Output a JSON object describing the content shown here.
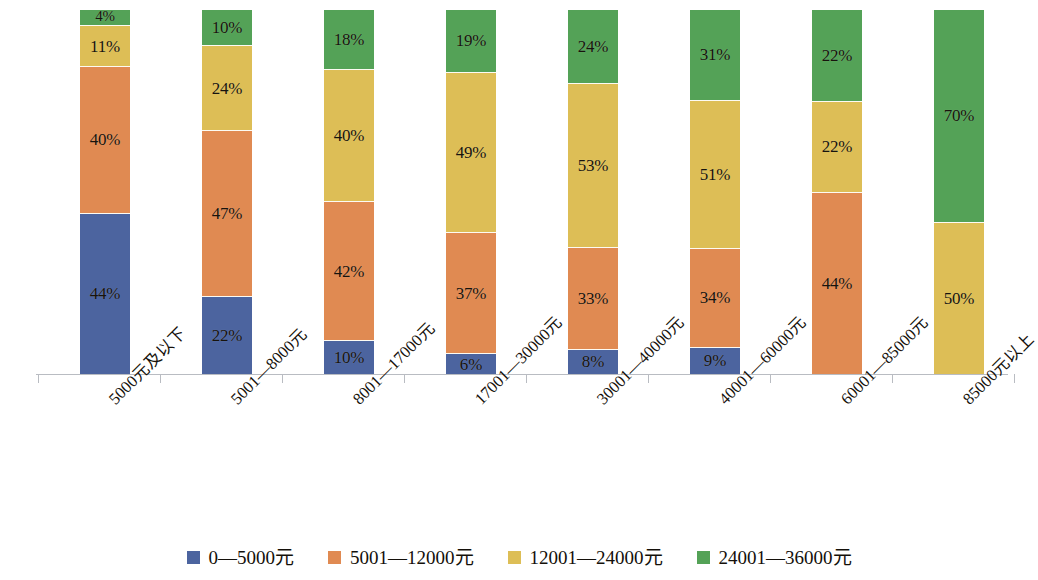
{
  "chart_data": {
    "type": "bar",
    "subtype": "stacked-100-percent",
    "title": "",
    "subtitle": "",
    "xlabel": "",
    "ylabel": "",
    "ylim": [
      0,
      100
    ],
    "grid": false,
    "legend_position": "bottom",
    "value_suffix": "%",
    "categories": [
      "5000元及以下",
      "5001—8000元",
      "8001—17000元",
      "17001—30000元",
      "30001—40000元",
      "40001—60000元",
      "60001—85000元",
      "85000元以上"
    ],
    "series": [
      {
        "name": "0—5000元",
        "color": "#4c649f",
        "values": [
          44,
          22,
          10,
          6,
          8,
          9,
          0,
          0
        ],
        "labels": [
          "44%",
          "22%",
          "10%",
          "6%",
          "8%",
          "9%",
          "",
          ""
        ]
      },
      {
        "name": "5001—12000元",
        "color": "#e08a52",
        "values": [
          40,
          47,
          42,
          37,
          33,
          34,
          44,
          0
        ],
        "labels": [
          "40%",
          "47%",
          "42%",
          "37%",
          "33%",
          "34%",
          "44%",
          ""
        ]
      },
      {
        "name": "12001—24000元",
        "color": "#ddbe56",
        "values": [
          11,
          24,
          40,
          49,
          53,
          51,
          22,
          50
        ],
        "labels": [
          "11%",
          "24%",
          "40%",
          "49%",
          "53%",
          "51%",
          "22%",
          "50%"
        ]
      },
      {
        "name": "24001—36000元",
        "color": "#54a257",
        "values": [
          4,
          10,
          18,
          19,
          24,
          31,
          22,
          70
        ],
        "labels": [
          "4%",
          "10%",
          "18%",
          "19%",
          "24%",
          "31%",
          "22%",
          "70%"
        ]
      }
    ],
    "axis_color": "#b9bcc2",
    "background": "#ffffff"
  },
  "legend": {
    "items": [
      {
        "label": "0—5000元",
        "color": "#4c649f"
      },
      {
        "label": "5001—12000元",
        "color": "#e08a52"
      },
      {
        "label": "12001—24000元",
        "color": "#ddbe56"
      },
      {
        "label": "24001—36000元",
        "color": "#54a257"
      }
    ]
  }
}
